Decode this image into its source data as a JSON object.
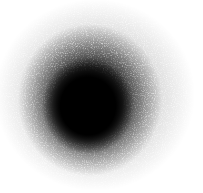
{
  "image": {
    "description": "soft grainy black blob on white background",
    "width": 203,
    "height": 193,
    "colors": {
      "background": "#ffffff",
      "blob_core": "#000000"
    },
    "blob": {
      "center_x": 88,
      "center_y": 106,
      "core_radius": 40,
      "fade_radius": 95
    }
  }
}
